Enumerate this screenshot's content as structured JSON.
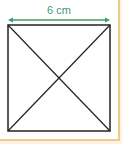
{
  "figure": {
    "shape": "square",
    "side_label": "6 cm",
    "has_diagonals": true,
    "colors": {
      "dimension_arrow": "#3f9a6a",
      "square_stroke": "#222222",
      "border_accent": "#f3c98a"
    }
  }
}
